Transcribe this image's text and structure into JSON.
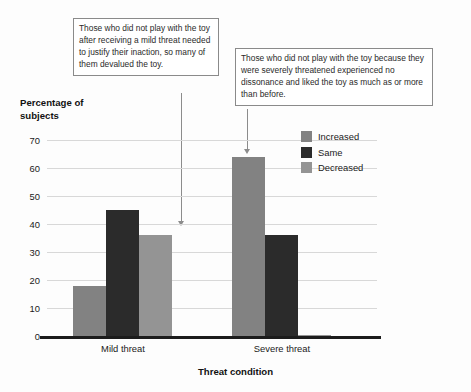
{
  "chart_data": {
    "type": "bar",
    "title": "",
    "xlabel": "Threat condition",
    "ylabel": "Percentage of subjects",
    "categories": [
      "Mild threat",
      "Severe threat"
    ],
    "series": [
      {
        "name": "Increased",
        "color": "#828282",
        "values": [
          18,
          64
        ]
      },
      {
        "name": "Same",
        "color": "#2b2b2b",
        "values": [
          45,
          36
        ]
      },
      {
        "name": "Decreased",
        "color": "#949494",
        "values": [
          36,
          0.5
        ]
      }
    ],
    "ylim": [
      0,
      70
    ],
    "yticks": [
      0,
      10,
      20,
      30,
      40,
      50,
      60,
      70
    ],
    "ytick_labels": [
      "0",
      "10",
      "20",
      "30",
      "40",
      "50",
      "60",
      "70"
    ],
    "grid": true,
    "legend_position": "top-right"
  },
  "axis": {
    "y_title_line1": "Percentage of",
    "y_title_line2": "subjects",
    "x_title": "Threat condition"
  },
  "annotations": [
    {
      "id": "mild",
      "text": "Those who did not play with the toy after receiving a mild threat needed to justify their inaction, so many of them devalued the toy.",
      "points_to": "Mild threat – Decreased"
    },
    {
      "id": "severe",
      "text": "Those who did not play with the toy because they were severely threatened experienced no dissonance and liked the toy as much as or more than before.",
      "points_to": "Severe threat – Increased"
    }
  ]
}
